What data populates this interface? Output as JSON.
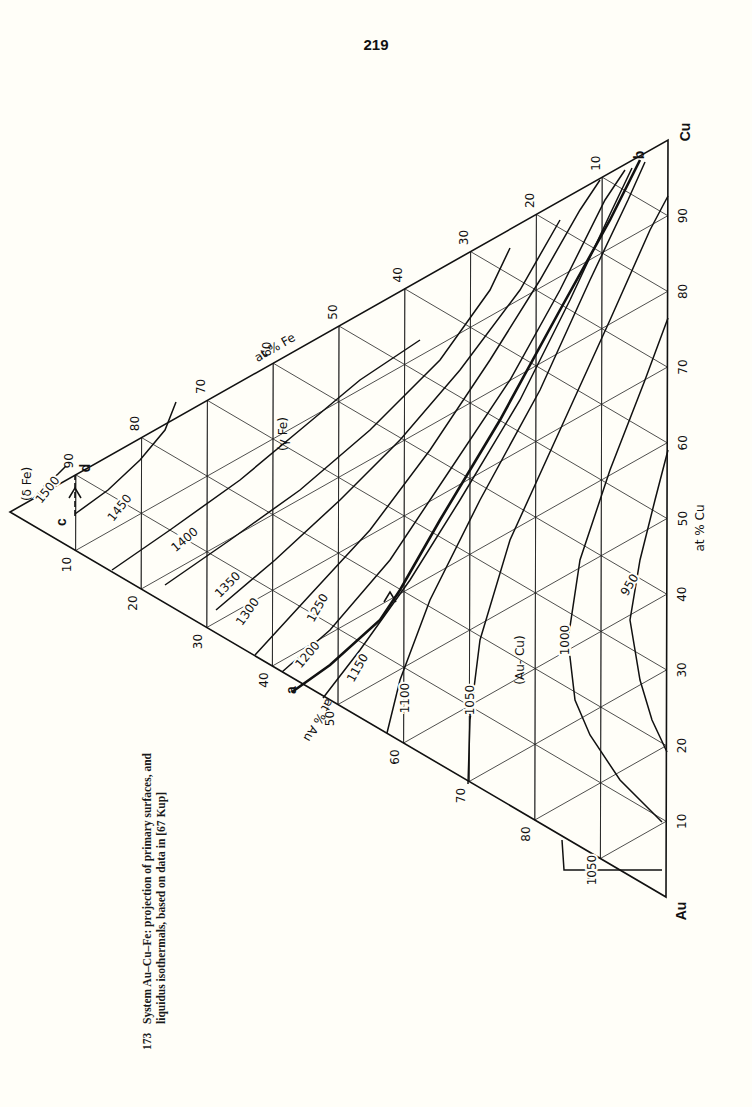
{
  "page": {
    "number": "219",
    "caption": {
      "figure_number": "173",
      "line1": "System Au–Cu–Fe: projection of primary surfaces, and",
      "line2": "liquidus isothermals, based on data in [67 Kup]"
    }
  },
  "chart_data": {
    "type": "ternary",
    "title": "System Au–Cu–Fe: projection of primary surfaces, and liquidus isothermals",
    "components": [
      "Au",
      "Cu",
      "Fe"
    ],
    "orientation": "rotated 90° counter-clockwise on page",
    "apex_px": {
      "Cu": [
        668,
        140
      ],
      "Au": [
        666,
        897
      ],
      "Fe": [
        10,
        512
      ]
    },
    "axes": [
      {
        "name": "at % Cu",
        "edge": "Au-Cu",
        "ticks": [
          10,
          20,
          30,
          40,
          50,
          60,
          70,
          80,
          90
        ]
      },
      {
        "name": "at % Fe",
        "edge": "Cu-Fe",
        "ticks": [
          10,
          20,
          30,
          40,
          50,
          60,
          70,
          80,
          90
        ]
      },
      {
        "name": "at % Au",
        "edge": "Fe-Au",
        "ticks": [
          10,
          20,
          30,
          40,
          50,
          60,
          70,
          80,
          90
        ]
      }
    ],
    "axis_label_positions": {
      "at % Cu": [
        700,
        528,
        -90
      ],
      "at % Fe": [
        275,
        348,
        -30
      ],
      "at % Au": [
        318,
        720,
        120
      ]
    },
    "apex_labels": {
      "Cu": "Cu",
      "Au": "Au",
      "Fe": ""
    },
    "grid": true,
    "phase_regions": [
      {
        "label": "(δ Fe)",
        "pos": [
          27,
          484,
          -90
        ]
      },
      {
        "label": "(γ Fe)",
        "pos": [
          283,
          434,
          -90
        ]
      },
      {
        "label": "(Au- Cu)",
        "pos": [
          520,
          660,
          -90
        ]
      }
    ],
    "points": [
      {
        "label": "a",
        "pos": [
          292,
          690
        ]
      },
      {
        "label": "b",
        "pos": [
          640,
          155
        ]
      },
      {
        "label": "c",
        "pos": [
          62,
          522
        ]
      },
      {
        "label": "d",
        "pos": [
          86,
          468
        ]
      }
    ],
    "isotherms": [
      {
        "T": 1500,
        "label_pos": [
          48,
          490,
          -52
        ],
        "path": [
          [
            33,
            499
          ],
          [
            45,
            485
          ],
          [
            58,
            474
          ],
          [
            66,
            466
          ]
        ]
      },
      {
        "T": 1450,
        "label_pos": [
          120,
          508,
          -52
        ],
        "path": [
          [
            75,
            514
          ],
          [
            108,
            490
          ],
          [
            140,
            460
          ],
          [
            165,
            430
          ],
          [
            176,
            402
          ]
        ]
      },
      {
        "T": 1400,
        "label_pos": [
          185,
          540,
          -40
        ],
        "path": [
          [
            112,
            570
          ],
          [
            170,
            530
          ],
          [
            240,
            480
          ],
          [
            300,
            430
          ],
          [
            360,
            380
          ],
          [
            420,
            340
          ]
        ]
      },
      {
        "T": 1350,
        "label_pos": [
          228,
          585,
          -45
        ],
        "path": [
          [
            165,
            585
          ],
          [
            230,
            540
          ],
          [
            300,
            490
          ],
          [
            370,
            430
          ],
          [
            440,
            360
          ],
          [
            490,
            290
          ],
          [
            510,
            248
          ]
        ]
      },
      {
        "T": 1300,
        "label_pos": [
          248,
          612,
          -55
        ],
        "path": [
          [
            216,
            610
          ],
          [
            275,
            560
          ],
          [
            340,
            500
          ],
          [
            400,
            440
          ],
          [
            460,
            370
          ],
          [
            520,
            290
          ],
          [
            560,
            220
          ]
        ]
      },
      {
        "T": 1250,
        "label_pos": [
          318,
          608,
          -60
        ],
        "path": [
          [
            255,
            655
          ],
          [
            310,
            595
          ],
          [
            370,
            530
          ],
          [
            430,
            450
          ],
          [
            490,
            360
          ],
          [
            540,
            280
          ],
          [
            580,
            210
          ],
          [
            600,
            180
          ]
        ]
      },
      {
        "T": 1200,
        "label_pos": [
          308,
          655,
          -50
        ],
        "path": [
          [
            282,
            672
          ],
          [
            330,
            630
          ],
          [
            390,
            560
          ],
          [
            450,
            470
          ],
          [
            510,
            380
          ],
          [
            560,
            290
          ],
          [
            605,
            200
          ],
          [
            625,
            170
          ]
        ]
      },
      {
        "T": 1150,
        "label_pos": [
          358,
          668,
          -60
        ],
        "path": [
          [
            323,
            698
          ],
          [
            360,
            650
          ],
          [
            410,
            580
          ],
          [
            460,
            500
          ],
          [
            520,
            400
          ],
          [
            570,
            300
          ],
          [
            612,
            210
          ],
          [
            632,
            168
          ]
        ]
      },
      {
        "T": 1100,
        "label_pos": [
          405,
          698,
          -90
        ],
        "path": [
          [
            387,
            733
          ],
          [
            400,
            680
          ],
          [
            430,
            600
          ],
          [
            480,
            500
          ],
          [
            540,
            390
          ],
          [
            590,
            280
          ],
          [
            628,
            200
          ],
          [
            645,
            162
          ]
        ]
      },
      {
        "T": 1050,
        "label_pos": [
          470,
          700,
          -90
        ],
        "path": [
          [
            468,
            784
          ],
          [
            470,
            720
          ],
          [
            480,
            640
          ],
          [
            510,
            540
          ],
          [
            560,
            430
          ],
          [
            610,
            320
          ],
          [
            650,
            230
          ],
          [
            668,
            196
          ]
        ]
      },
      {
        "T": 1000,
        "label_pos": [
          565,
          640,
          -90
        ],
        "path": [
          [
            662,
            822
          ],
          [
            620,
            780
          ],
          [
            590,
            735
          ],
          [
            575,
            700
          ],
          [
            568,
            640
          ],
          [
            580,
            560
          ],
          [
            610,
            470
          ],
          [
            645,
            380
          ],
          [
            668,
            318
          ]
        ]
      },
      {
        "T": 950,
        "label_pos": [
          630,
          585,
          -60
        ],
        "path": [
          [
            667,
            752
          ],
          [
            652,
            720
          ],
          [
            640,
            680
          ],
          [
            630,
            620
          ],
          [
            640,
            560
          ],
          [
            655,
            500
          ],
          [
            668,
            450
          ]
        ]
      },
      {
        "T": 1050,
        "label_pos": [
          592,
          870,
          -90
        ],
        "path": [
          [
            562,
            840
          ],
          [
            564,
            870
          ],
          [
            662,
            870
          ]
        ]
      }
    ],
    "monovariant_curves": [
      {
        "name": "a-b",
        "path": [
          [
            292,
            692
          ],
          [
            330,
            665
          ],
          [
            380,
            620
          ],
          [
            400,
            590
          ],
          [
            440,
            520
          ],
          [
            500,
            420
          ],
          [
            560,
            310
          ],
          [
            610,
            220
          ],
          [
            640,
            160
          ]
        ],
        "arrow_at": [
          390,
          600
        ],
        "arrow_direction": "toward b"
      },
      {
        "name": "c-d",
        "style": "dashed",
        "path": [
          [
            75,
            516
          ],
          [
            75,
            476
          ]
        ],
        "arrow_at": [
          75,
          496
        ],
        "arrow_direction": "toward c"
      }
    ]
  }
}
